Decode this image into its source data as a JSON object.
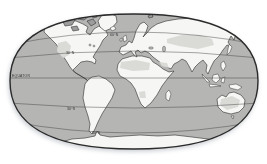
{
  "labels": {
    "lat_60n": "60°N",
    "lat_30n": "30°N",
    "equator": "EQUATOR",
    "lat_30s": "30°S",
    "lat_60s": "60°S"
  },
  "colors": {
    "background": "#ffffff",
    "ocean": "#b5b6b4",
    "land": "#f6f6f4",
    "shaded_region": "#dadad7",
    "arctic_land": "#9c9c9c",
    "outline": "#2b2b2b",
    "latitude_line": "#3d3d3d",
    "label_text": "#333333"
  }
}
